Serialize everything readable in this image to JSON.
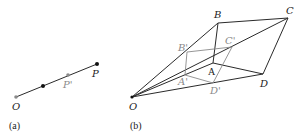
{
  "panel_a": {
    "caption": "(a)",
    "labels": {
      "O": "O",
      "P_prime": "P'",
      "P": "P"
    }
  },
  "panel_b": {
    "caption": "(b)",
    "labels": {
      "O": "O",
      "A": "A",
      "B": "B",
      "C": "C",
      "D": "D",
      "A_prime": "A'",
      "B_prime": "B'",
      "C_prime": "C'",
      "D_prime": "D'"
    }
  },
  "colors": {
    "line": "#2a2a2a",
    "gray": "#8a8a8a"
  }
}
